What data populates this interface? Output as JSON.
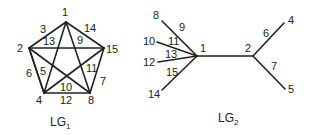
{
  "diagrams": [
    {
      "id": "LG1",
      "caption": "LG",
      "caption_sub": "1",
      "nodes": [
        {
          "label": "1",
          "x": 66,
          "y": 22,
          "lx": 62,
          "ly": 16
        },
        {
          "label": "2",
          "x": 29,
          "y": 48,
          "lx": 17,
          "ly": 52
        },
        {
          "label": "15",
          "x": 104,
          "y": 48,
          "lx": 106,
          "ly": 53
        },
        {
          "label": "4",
          "x": 44,
          "y": 93,
          "lx": 36,
          "ly": 104
        },
        {
          "label": "8",
          "x": 90,
          "y": 93,
          "lx": 88,
          "ly": 104
        }
      ],
      "edges": [
        {
          "from": "1",
          "to": "2",
          "label": "3",
          "lx": 40,
          "ly": 33
        },
        {
          "from": "1",
          "to": "15",
          "label": "14",
          "lx": 84,
          "ly": 32
        },
        {
          "from": "2",
          "to": "4",
          "label": "6",
          "lx": 26,
          "ly": 77
        },
        {
          "from": "15",
          "to": "8",
          "label": "7",
          "lx": 100,
          "ly": 85
        },
        {
          "from": "4",
          "to": "8",
          "label": "12",
          "lx": 60,
          "ly": 104
        },
        {
          "from": "1",
          "to": "4",
          "label": "13",
          "lx": 43,
          "ly": 45
        },
        {
          "from": "1",
          "to": "8",
          "label": "9",
          "lx": 77,
          "ly": 44
        },
        {
          "from": "2",
          "to": "15",
          "label": "",
          "lx": 0,
          "ly": 0
        },
        {
          "from": "2",
          "to": "8",
          "label": "10",
          "lx": 60,
          "ly": 91
        },
        {
          "from": "15",
          "to": "4",
          "label": "11",
          "lx": 86,
          "ly": 72
        },
        {
          "from": "2",
          "to": "4",
          "label": "5",
          "lx": 40,
          "ly": 75
        }
      ]
    },
    {
      "id": "LG2",
      "caption": "LG",
      "caption_sub": "2",
      "nodes": [
        {
          "label": "1",
          "x": 197,
          "y": 56,
          "lx": 200,
          "ly": 52
        },
        {
          "label": "2",
          "x": 253,
          "y": 56,
          "lx": 245,
          "ly": 52
        },
        {
          "label": "8",
          "x": 162,
          "y": 21,
          "lx": 153,
          "ly": 19
        },
        {
          "label": "10",
          "x": 157,
          "y": 42,
          "lx": 143,
          "ly": 45
        },
        {
          "label": "12",
          "x": 158,
          "y": 62,
          "lx": 143,
          "ly": 66
        },
        {
          "label": "14",
          "x": 162,
          "y": 90,
          "lx": 148,
          "ly": 98
        },
        {
          "label": "4",
          "x": 284,
          "y": 23,
          "lx": 288,
          "ly": 24
        },
        {
          "label": "5",
          "x": 285,
          "y": 89,
          "lx": 288,
          "ly": 93
        }
      ],
      "edges": [
        {
          "from": "1",
          "to": "2",
          "label": "",
          "lx": 0,
          "ly": 0
        },
        {
          "from": "1",
          "to": "8",
          "label": "9",
          "lx": 179,
          "ly": 31
        },
        {
          "from": "1",
          "to": "10",
          "label": "11",
          "lx": 168,
          "ly": 45
        },
        {
          "from": "1",
          "to": "12",
          "label": "13",
          "lx": 165,
          "ly": 58
        },
        {
          "from": "1",
          "to": "14",
          "label": "15",
          "lx": 166,
          "ly": 76
        },
        {
          "from": "2",
          "to": "4",
          "label": "6",
          "lx": 263,
          "ly": 37
        },
        {
          "from": "2",
          "to": "5",
          "label": "7",
          "lx": 271,
          "ly": 70
        }
      ]
    }
  ],
  "captions": {
    "lg1": {
      "base": "LG",
      "sub": "1",
      "x": 50,
      "y": 126
    },
    "lg2": {
      "base": "LG",
      "sub": "2",
      "x": 218,
      "y": 122
    }
  }
}
